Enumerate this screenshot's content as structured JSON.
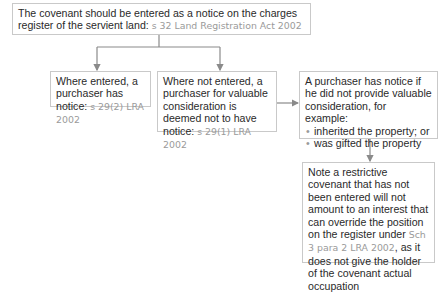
{
  "diagram": {
    "colors": {
      "text": "#2a2a2a",
      "reference": "#9a9a9a",
      "border": "#c9c9c9",
      "connector": "#8a8a8a"
    },
    "nodes": {
      "top": {
        "text": "The covenant should be entered as a notice on the charges register of the servient land: ",
        "ref": "s 32 Land Registration Act 2002"
      },
      "entered": {
        "text": "Where entered, a purchaser has notice: ",
        "ref": "s 29(2) LRA 2002"
      },
      "not_entered": {
        "text": "Where not entered, a purchaser for valuable consideration is deemed not to have notice: ",
        "ref": "s 29(1) LRA 2002"
      },
      "purchaser_notice": {
        "text": "A purchaser has notice if he did not provide valuable consideration, for example:",
        "bullets": [
          "inherited the property; or",
          "was gifted the property"
        ]
      },
      "note": {
        "text_before": "Note a restrictive covenant that has not been entered will not amount to an interest that can override the position on the register under ",
        "ref": "Sch 3 para 2 LRA 2002",
        "text_after": ", as it does not give the holder of the covenant actual occupation"
      }
    },
    "edges": [
      {
        "from": "top",
        "to": "entered"
      },
      {
        "from": "top",
        "to": "not_entered"
      },
      {
        "from": "not_entered",
        "to": "purchaser_notice"
      },
      {
        "from": "purchaser_notice",
        "to": "note"
      }
    ]
  }
}
